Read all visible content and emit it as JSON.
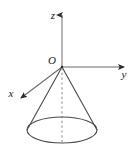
{
  "figure": {
    "background_color": "#ffffff",
    "line_color": "#4a4a4a",
    "axis_color": "#555555",
    "label_color": "#1a1a1a",
    "labels": {
      "z_axis": "z",
      "y_axis": "y",
      "x_axis": "x",
      "origin": "O"
    },
    "geometry": {
      "origin": {
        "x": 62,
        "y": 67
      },
      "z_axis_tip": {
        "x": 62,
        "y": 11
      },
      "y_axis_tip": {
        "x": 129,
        "y": 67
      },
      "x_axis_tip": {
        "x": 16,
        "y": 101
      },
      "base_ellipse": {
        "cx": 62,
        "cy": 130,
        "rx": 35,
        "ry": 13
      },
      "axis_dashed": true,
      "cone_apex_at_origin": true
    },
    "label_positions": {
      "z": {
        "x": 54,
        "y": 18
      },
      "y": {
        "x": 122,
        "y": 77
      },
      "x": {
        "x": 8,
        "y": 97
      },
      "O": {
        "x": 47,
        "y": 64
      }
    }
  }
}
